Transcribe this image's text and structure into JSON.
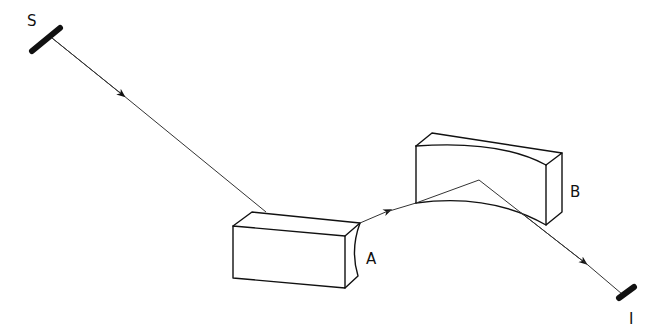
{
  "diagram": {
    "type": "optical-path",
    "labels": {
      "source": "S",
      "first_element": "A",
      "second_element": "B",
      "image": "I"
    },
    "colors": {
      "line": "#111111",
      "background": "#ffffff"
    }
  }
}
